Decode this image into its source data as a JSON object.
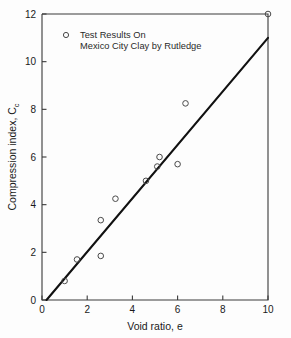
{
  "chart_data": {
    "type": "scatter",
    "title": "",
    "xlabel": "Void ratio, e",
    "ylabel_main": "Compression index, C",
    "ylabel_sub": "c",
    "ylabel_full": "Compression index, Cc",
    "xlim": [
      0,
      10
    ],
    "ylim": [
      0,
      12
    ],
    "xticks": [
      0,
      2,
      4,
      6,
      8,
      10
    ],
    "yticks": [
      0,
      2,
      4,
      6,
      8,
      10,
      12
    ],
    "xtick_labels": [
      "0",
      "2",
      "4",
      "6",
      "8",
      "10"
    ],
    "ytick_labels": [
      "0",
      "2",
      "4",
      "6",
      "8",
      "10",
      "12"
    ],
    "grid": false,
    "legend_position": "upper-left-inside",
    "marker_style": "open-circle",
    "series": [
      {
        "name": "Test Results On Mexico City Clay by Rutledge",
        "marker": "open-circle",
        "points": [
          {
            "x": 1.0,
            "y": 0.8
          },
          {
            "x": 1.55,
            "y": 1.7
          },
          {
            "x": 2.6,
            "y": 1.85
          },
          {
            "x": 2.6,
            "y": 3.35
          },
          {
            "x": 3.25,
            "y": 4.25
          },
          {
            "x": 4.6,
            "y": 5.0
          },
          {
            "x": 5.1,
            "y": 5.6
          },
          {
            "x": 5.2,
            "y": 6.0
          },
          {
            "x": 6.0,
            "y": 5.7
          },
          {
            "x": 6.35,
            "y": 8.25
          },
          {
            "x": 10.0,
            "y": 12.0
          }
        ]
      }
    ],
    "trend_line": {
      "name": "best-fit line",
      "x1": 0.2,
      "y1": 0.0,
      "x2": 10.0,
      "y2": 11.0
    }
  },
  "legend": {
    "marker_label": "legend-marker",
    "line1": "Test Results On",
    "line2": "Mexico City Clay by Rutledge"
  },
  "colors": {
    "axis": "#3a3a3a",
    "trend": "#111111",
    "marker": "#4a4a4a",
    "text": "#1a1a1a",
    "background": "#fdfdfd"
  }
}
